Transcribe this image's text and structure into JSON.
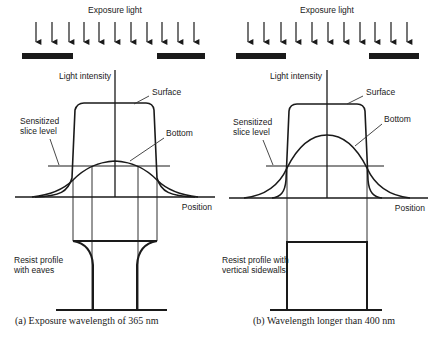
{
  "panels": [
    {
      "id": "a",
      "exposure_label": "Exposure light",
      "y_axis_label": "Light intensity",
      "surface_label": "Surface",
      "bottom_label": "Bottom",
      "slice_label_line1": "Sensitized",
      "slice_label_line2": "slice level",
      "x_axis_label": "Position",
      "resist_label_line1": "Resist profile",
      "resist_label_line2": "with eaves",
      "caption": "(a)  Exposure wavelength of 365 nm"
    },
    {
      "id": "b",
      "exposure_label": "Exposure light",
      "y_axis_label": "Light intensity",
      "surface_label": "Surface",
      "bottom_label": "Bottom",
      "slice_label_line1": "Sensitized",
      "slice_label_line2": "slice level",
      "x_axis_label": "Position",
      "resist_label_line1": "Resist profile with",
      "resist_label_line2": "vertical sidewalls",
      "caption": "(b)  Wavelength longer than 400 nm"
    }
  ],
  "colors": {
    "ink": "#1a1a1a",
    "thin_line": "#333333",
    "background": "#ffffff"
  }
}
